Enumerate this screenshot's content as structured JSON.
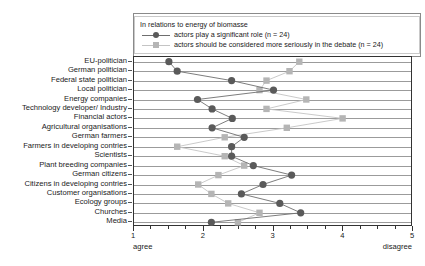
{
  "chart_data": {
    "type": "line",
    "title": "",
    "legend_title": "In relations to energy of biomasse",
    "legend_position": "top-right-inside",
    "grid": true,
    "orientation": "horizontal",
    "xlabel": "",
    "ylabel": "",
    "xlim": [
      1,
      5
    ],
    "xticks": [
      1,
      2,
      3,
      4
    ],
    "xtick_labels": [
      "1",
      "2",
      "3",
      "4",
      "5"
    ],
    "xtick_values": [
      1,
      2,
      3,
      4,
      5
    ],
    "x_minor_step": 0.25,
    "x_end_labels": {
      "left": "agree",
      "right": "disagree"
    },
    "categories": [
      "EU-politician",
      "German politician",
      "Federal state politician",
      "Local politician",
      "Energy companies",
      "Technology developer/ Industry",
      "Financial actors",
      "Agricultural organisations",
      "German farmers",
      "Farmers in developing contries",
      "Scientists",
      "Plant breeding companies",
      "German citizens",
      "Citizens in developing contries",
      "Customer organisations",
      "Ecology groups",
      "Churches",
      "Media"
    ],
    "series": [
      {
        "name": "actors play a significant role (n = 24)",
        "marker": "circle",
        "color": "#5a5a5a",
        "line_color": "#6e6e6e",
        "values": [
          1.5,
          1.62,
          2.4,
          3.0,
          1.91,
          2.12,
          2.41,
          2.12,
          2.58,
          2.4,
          2.4,
          2.71,
          3.26,
          2.85,
          2.54,
          3.09,
          3.39,
          2.11
        ]
      },
      {
        "name": "actors should be considered more seriously in the debate (n = 24)",
        "marker": "square",
        "color": "#b5b5b5",
        "line_color": "#c4c4c4",
        "values": [
          3.37,
          3.23,
          2.9,
          2.8,
          3.47,
          2.9,
          3.99,
          3.19,
          2.3,
          1.62,
          2.3,
          2.58,
          2.21,
          1.92,
          2.11,
          2.35,
          2.8,
          2.49
        ]
      }
    ]
  },
  "colors": {
    "series_dark": "#5a5a5a",
    "series_light": "#b5b5b5",
    "grid": "#9b9b9b",
    "axis": "#333333",
    "text": "#1a1a1a"
  }
}
